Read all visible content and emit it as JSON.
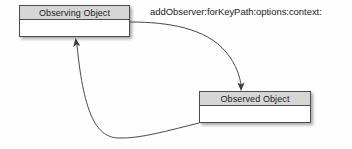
{
  "diagram": {
    "background_color": "#fefefe",
    "nodes": [
      {
        "id": "observing-object",
        "header_label": "Observing Object",
        "body_label": "",
        "header_fill": "#d6d6d6",
        "body_fill": "#ffffff",
        "border_color": "#4d4d4d"
      },
      {
        "id": "observed-object",
        "header_label": "Observed Object",
        "body_label": "",
        "header_fill": "#d6d6d6",
        "body_fill": "#ffffff",
        "border_color": "#4d4d4d"
      }
    ],
    "edges": [
      {
        "id": "register-edge",
        "label": "addObserver:forKeyPath:options:context:",
        "from": "observing-object",
        "to": "observed-object",
        "stroke": "#4a4a4a"
      },
      {
        "id": "notify-edge",
        "label": "",
        "from": "observed-object",
        "to": "observing-object",
        "stroke": "#4a4a4a"
      }
    ]
  }
}
